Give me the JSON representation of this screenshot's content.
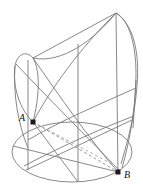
{
  "figure": {
    "type": "geometric-solid-diagram",
    "colors": {
      "background": "#ffffff",
      "stroke": "#7a7a7a",
      "stroke_dark": "#6b6b6b",
      "point_fill": "#1a1a1a",
      "label_color": "#111111",
      "dashed_stroke": "#8d8d8d"
    },
    "stroke_width": 0.9,
    "dash_pattern": "3,2.4"
  },
  "points": [
    {
      "name": "A",
      "label": "A",
      "x": 33,
      "y": 122,
      "marker": "filled-square",
      "marker_size": 5,
      "label_x": 19,
      "label_y": 113
    },
    {
      "name": "B",
      "label": "B",
      "x": 118,
      "y": 172,
      "marker": "filled-square",
      "marker_size": 5,
      "label_x": 124,
      "label_y": 170
    }
  ],
  "base_ellipse": {
    "cx": 72,
    "cy": 152,
    "rx": 60,
    "ry": 30
  },
  "apex": {
    "x": 116,
    "y": 13
  },
  "left_lobe_tip": {
    "x": 15,
    "y": 56
  },
  "chord": {
    "name": "A-B dashed chord",
    "from": "A",
    "to": "B",
    "style": "dashed"
  },
  "paths": {
    "outline_right": "M 116 13 C 133 24 139 52 137 84 C 135 112 129 136 121 163",
    "outline_left_lobe": "M 28 126 C 16 110 11 82 16 64 C 19 53 27 51 33 58",
    "lobe_inner": "M 33 58 C 40 70 38 96 33 122",
    "ridge_top_left": "M 33 58 L 116 13",
    "ridge_mid": "M 33 58 C 62 63 93 40 116 13",
    "curve_big_1": "M 28 126 C 52 92 82 50 116 13",
    "curve_big_2": "M 33 58 C 56 92 88 138 118 172",
    "curve_big_3": "M 15 60 C 48 90 90 132 121 163",
    "curve_base_front": "M 12 152 C 30 118 70 86 116 13",
    "section_curve": "M 12 150 C 44 120 92 104 137 86",
    "section_curve_2": "M 23 172 C 56 146 100 128 133 118",
    "rule_v1": "M 28 58 L 28 168",
    "rule_v2": "M 78 42 L 78 182",
    "rule_v3": "M 116 13 L 118 172",
    "rule_v4": "M 137 84 L 134 132",
    "rule_diag_1": "M 33 122 L 78 182",
    "rule_diag_2": "M 12 152 L 118 172",
    "rule_diag_3": "M 28 168 L 133 118",
    "chord_dashed": "M 33 122 L 118 172",
    "chord_dashed_2": "M 33 122 L 110 166"
  }
}
